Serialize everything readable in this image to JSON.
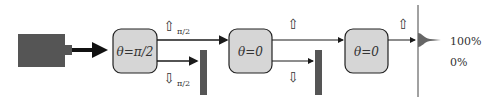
{
  "source": {
    "label": "laser-source"
  },
  "boxes": [
    {
      "label": "θ=π/2"
    },
    {
      "label": "θ=0"
    },
    {
      "label": "θ=0"
    }
  ],
  "markers": {
    "up1": "⇧",
    "up1_sub": "π/2",
    "down1": "⇩",
    "down1_sub": "π/2",
    "up2": "⇧",
    "down2": "⇩",
    "up3": "⇧"
  },
  "output": {
    "high_label": "100%",
    "low_label": "0%"
  },
  "colors": {
    "source": "#555555",
    "box_fill": "#d6d6d6",
    "detector": "#555555",
    "line": "#1a1a1a"
  }
}
